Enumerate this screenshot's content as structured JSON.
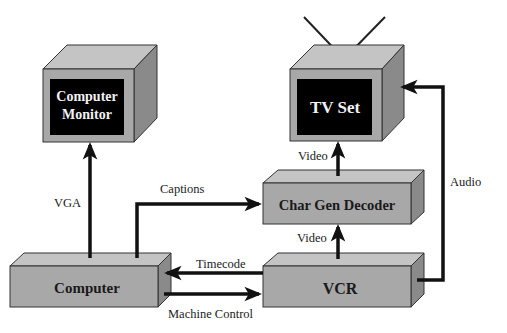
{
  "diagram": {
    "type": "signal-flow",
    "colors": {
      "box_front": "#a8a8a8",
      "box_top": "#c4c4c4",
      "box_side": "#8a8a8a",
      "screen": "#000000",
      "line": "#111111",
      "background": "#ffffff"
    },
    "nodes": {
      "monitor": {
        "label_line1": "Computer",
        "label_line2": "Monitor"
      },
      "tv": {
        "label": "TV Set"
      },
      "chargen": {
        "label": "Char Gen Decoder"
      },
      "vcr": {
        "label": "VCR"
      },
      "computer": {
        "label": "Computer"
      }
    },
    "edges": {
      "vga": {
        "label": "VGA",
        "from": "Computer",
        "to": "Computer Monitor"
      },
      "captions": {
        "label": "Captions",
        "from": "Computer",
        "to": "Char Gen Decoder"
      },
      "video_top": {
        "label": "Video",
        "from": "Char Gen Decoder",
        "to": "TV Set"
      },
      "video_bottom": {
        "label": "Video",
        "from": "VCR",
        "to": "Char Gen Decoder"
      },
      "timecode": {
        "label": "Timecode",
        "from": "VCR",
        "to": "Computer"
      },
      "machine_control": {
        "label": "Machine Control",
        "from": "Computer",
        "to": "VCR"
      },
      "audio": {
        "label": "Audio",
        "from": "VCR",
        "to": "TV Set"
      }
    }
  }
}
